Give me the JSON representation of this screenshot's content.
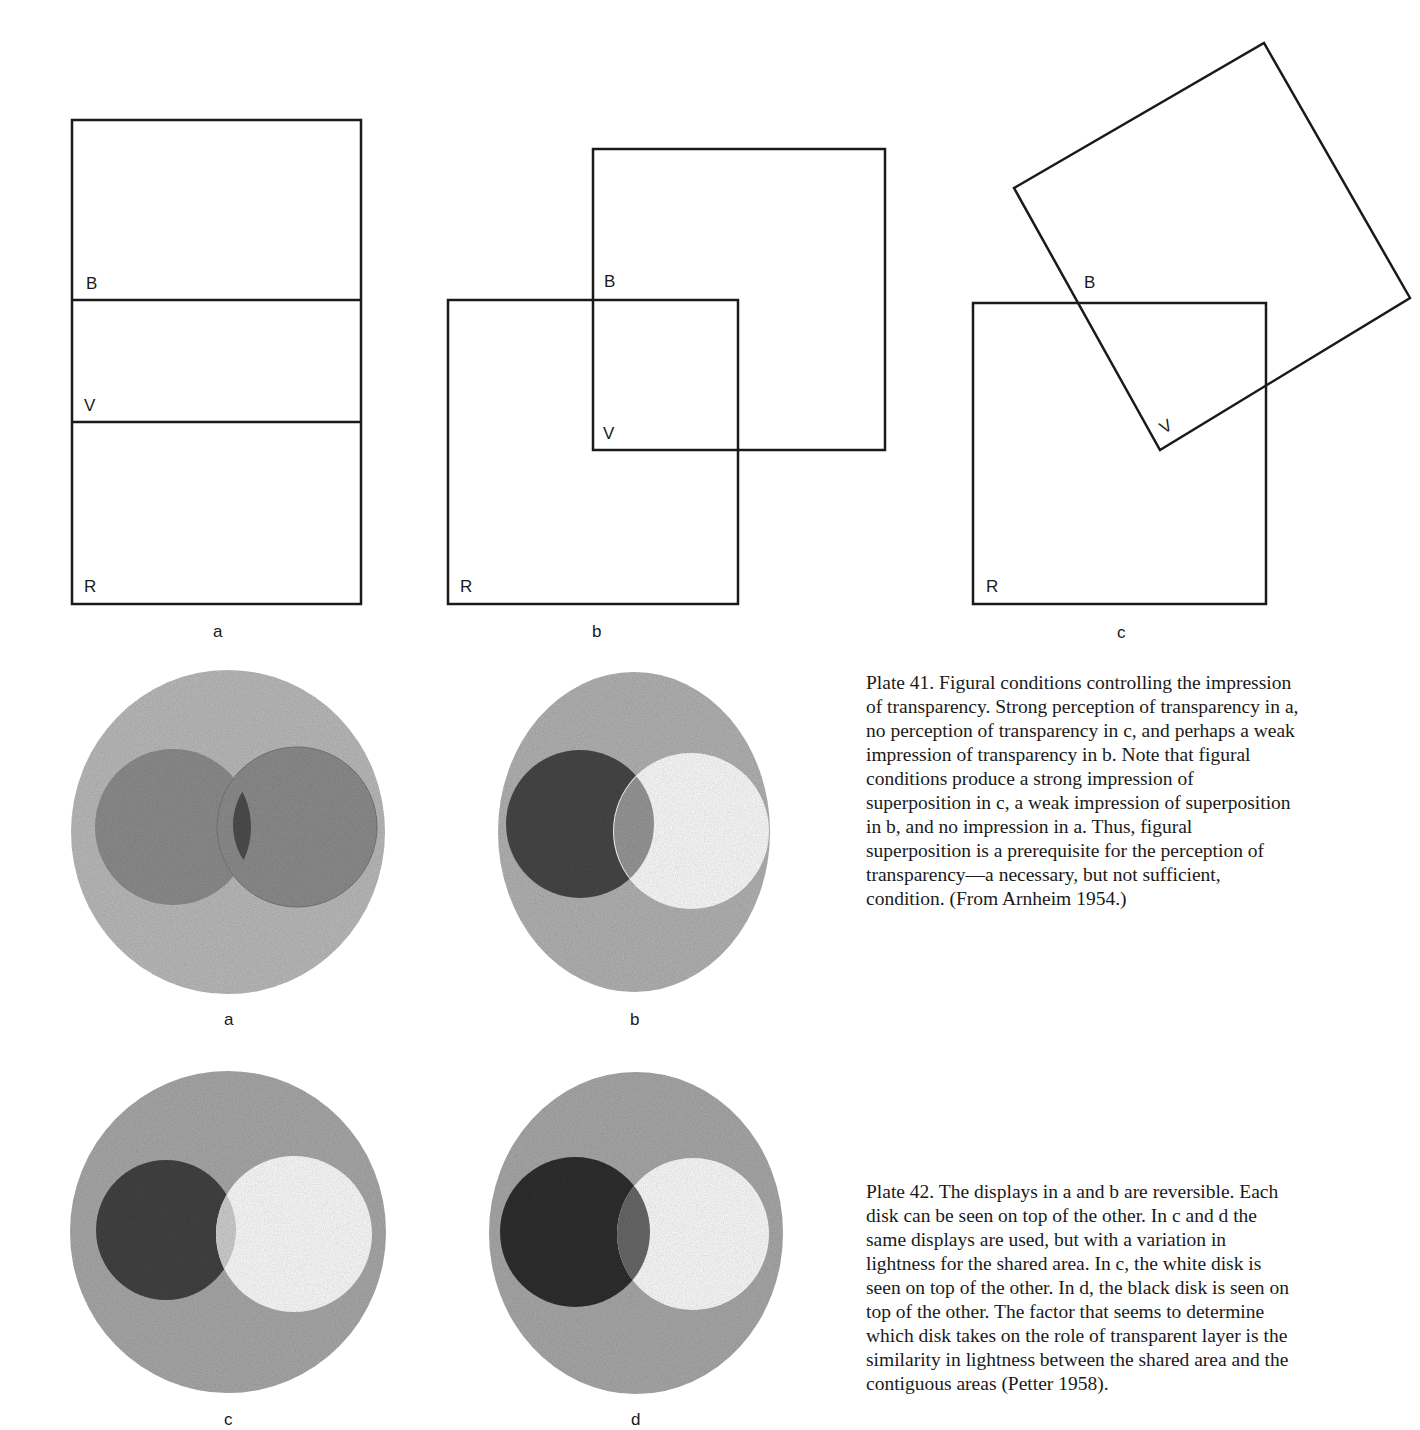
{
  "plate41": {
    "figures": [
      {
        "id": "a",
        "label": "a",
        "region_labels": [
          "B",
          "V",
          "R"
        ]
      },
      {
        "id": "b",
        "label": "b",
        "region_labels": [
          "B",
          "V",
          "R"
        ]
      },
      {
        "id": "c",
        "label": "c",
        "region_labels": [
          "B",
          "V",
          "R"
        ]
      }
    ],
    "caption": {
      "lines": [
        "Plate 41. Figural conditions controlling the impression",
        "of transparency. Strong perception of transparency in a,",
        "no perception of transparency in c, and perhaps a weak",
        "impression of transparency in b. Note that figural",
        "conditions produce a strong impression of",
        "superposition in c, a weak impression of superposition",
        "in b, and no impression in a. Thus, figural",
        "superposition is a prerequisite for the perception of",
        "transparency—a necessary, but not sufficient,",
        "condition. (From Arnheim 1954.)"
      ]
    }
  },
  "plate42": {
    "figures": [
      {
        "id": "a",
        "label": "a"
      },
      {
        "id": "b",
        "label": "b"
      },
      {
        "id": "c",
        "label": "c"
      },
      {
        "id": "d",
        "label": "d"
      }
    ],
    "caption": {
      "lines": [
        "Plate 42. The displays in a and b are reversible. Each",
        "disk can be seen on top of the other. In c and d the",
        "same displays are used, but with a variation in",
        "lightness for the shared area. In c, the white disk is",
        "seen on top of the other. In d, the black disk is seen on",
        "top of the other. The factor that seems to determine",
        "which disk takes on the role of transparent layer is the",
        "similarity in lightness between the shared area and the",
        "contiguous areas (Petter 1958)."
      ]
    }
  },
  "colors": {
    "ink": "#1a1a1a",
    "outer_disk": "#bdbdbd",
    "mid_disk": "#8f8f8f",
    "dark_disk": "#4a4a4a",
    "overlap_dark": "#5a5a5a",
    "light_overlap": "#cfcfcf",
    "white": "#ffffff"
  }
}
